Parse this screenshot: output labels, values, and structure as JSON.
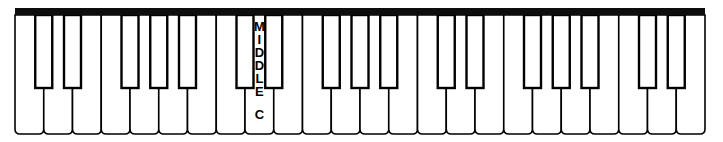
{
  "figure": {
    "name": "piano-keyboard-diagram",
    "type": "line-art",
    "width": 723,
    "height": 142
  },
  "colors": {
    "stroke": "#000000",
    "white_key_fill": "#ffffff",
    "black_key_fill": "#ffffff",
    "top_bar": "#0d0d0d",
    "label_text": "#000000"
  },
  "keyboard": {
    "white_key_count": 24,
    "black_key_count": 17,
    "black_key_pattern": "2-3-2-3-2-3-2",
    "first_white_key_note": "F",
    "top_bar_label": "keyboard-backrail",
    "white_key_bottom_corner_radius": 5
  },
  "labels": {
    "middle_c": {
      "text": "MIDDLE C",
      "letters": [
        "M",
        "I",
        "D",
        "D",
        "L",
        "E"
      ],
      "second_word": "C",
      "orientation": "vertical-stacked",
      "on_white_key_index": 8
    }
  },
  "geometry": {
    "left_margin": 15,
    "right_margin": 18,
    "top_bar_y": 8,
    "top_bar_height": 7,
    "keys_top": 15,
    "keys_bottom": 134,
    "black_key_bottom": 88,
    "black_key_width": 17
  }
}
